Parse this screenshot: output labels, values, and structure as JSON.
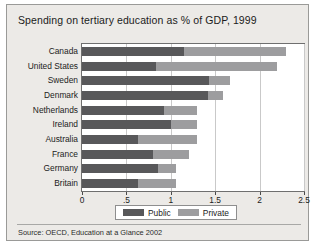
{
  "figure": {
    "title": "Spending on tertiary education as % of GDP, 1999",
    "source": "Source:  OECD, Education at a Glance 2002",
    "background_color": "#eceae7",
    "plot_background_color": "#ffffff",
    "border_color": "#9a9a98"
  },
  "chart_data": {
    "type": "bar",
    "orientation": "horizontal",
    "stacked": true,
    "title": "Spending on tertiary education as % of GDP, 1999",
    "xlabel": "",
    "ylabel": "",
    "xlim": [
      0,
      2.5
    ],
    "xticks": [
      0,
      0.5,
      1,
      1.5,
      2,
      2.5
    ],
    "xtick_labels": [
      "0",
      ".5",
      "1",
      "1.5",
      "2",
      "2.5"
    ],
    "grid": true,
    "grid_axis": "x",
    "legend_position": "bottom",
    "categories": [
      "Canada",
      "United States",
      "Sweden",
      "Denmark",
      "Netherlands",
      "Ireland",
      "Australia",
      "France",
      "Germany",
      "Britain"
    ],
    "series": [
      {
        "name": "Public",
        "color": "#58585a",
        "values": [
          1.15,
          0.83,
          1.43,
          1.42,
          0.92,
          1.0,
          0.63,
          0.8,
          0.86,
          0.63
        ]
      },
      {
        "name": "Private",
        "color": "#9d9d9f",
        "values": [
          1.15,
          1.37,
          0.24,
          0.17,
          0.37,
          0.29,
          0.66,
          0.41,
          0.2,
          0.43
        ]
      }
    ],
    "totals": [
      2.3,
      2.2,
      1.67,
      1.59,
      1.29,
      1.29,
      1.29,
      1.21,
      1.06,
      1.06
    ]
  },
  "legend": {
    "items": [
      {
        "label": "Public",
        "color": "#58585a"
      },
      {
        "label": "Private",
        "color": "#9d9d9f"
      }
    ]
  }
}
